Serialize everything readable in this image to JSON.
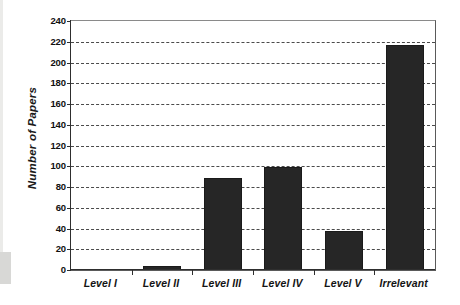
{
  "chart_data": {
    "type": "bar",
    "title": "",
    "xlabel": "",
    "ylabel": "Number of Papers",
    "categories": [
      "Level I",
      "Level II",
      "Level III",
      "Level IV",
      "Level V",
      "Irrelevant"
    ],
    "values": [
      0,
      4,
      89,
      99,
      38,
      217
    ],
    "ylim": [
      0,
      240
    ],
    "ytick_step": 20,
    "yticks": [
      0,
      20,
      40,
      60,
      80,
      100,
      120,
      140,
      160,
      180,
      200,
      220,
      240
    ],
    "ytick_labels": [
      "0",
      "20",
      "40",
      "60",
      "80",
      "100",
      "120",
      "140",
      "160",
      "180",
      "200",
      "220",
      "240"
    ],
    "grid": true,
    "grid_axis": "y",
    "grid_style": "dashed",
    "legend": false,
    "bar_color": "#262626",
    "plot_background": "#ffffff",
    "grid_color": "#2b2b2b",
    "axis_color": "#2e2e2e"
  }
}
